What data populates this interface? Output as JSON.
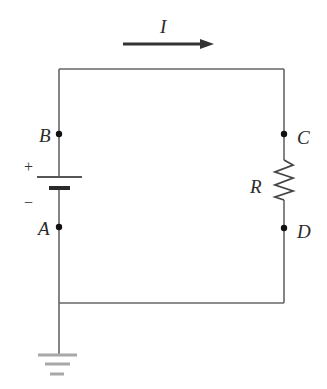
{
  "diagram": {
    "type": "circuit",
    "current": {
      "label": "I",
      "direction": "right"
    },
    "nodes": [
      {
        "label": "A",
        "side": "left",
        "position": "below battery"
      },
      {
        "label": "B",
        "side": "left",
        "position": "above battery"
      },
      {
        "label": "C",
        "side": "right",
        "position": "above resistor"
      },
      {
        "label": "D",
        "side": "right",
        "position": "below resistor"
      }
    ],
    "components": {
      "battery": {
        "positive_label": "+",
        "negative_label": "−"
      },
      "resistor": {
        "label": "R"
      },
      "ground": {
        "label": ""
      }
    },
    "colors": {
      "wire": "#555555",
      "arrow": "#333333",
      "ground": "#a8a8a8",
      "node": "#111111"
    }
  }
}
